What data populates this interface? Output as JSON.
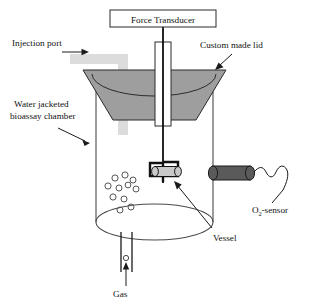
{
  "figure": {
    "title_box": {
      "label": "Force Transducer"
    },
    "labels": {
      "injection_port": "Injection port",
      "custom_made_lid": "Custom made lid",
      "water_jacketed_line1": "Water jacketed",
      "water_jacketed_line2": "bioassay chamber",
      "vessel": "Vessel",
      "gas": "Gas",
      "o2_sensor_main": "O",
      "o2_sensor_sub": "2",
      "o2_sensor_tail": "-sensor"
    },
    "colors": {
      "outline": "#1a1a1a",
      "chamber_wall": "#4a4a4a",
      "lid_fill": "#9e9e9e",
      "lid_stroke": "#2b2b2b",
      "injection_tube": "#dcdcdc",
      "sensor_fill": "#5a5a5a",
      "sensor_stroke": "#1a1a1a",
      "vessel_fill": "#c9c9c9",
      "bracket": "#111111",
      "rod": "#000000",
      "bubble_stroke": "#555555",
      "text": "#111111",
      "background": "#ffffff"
    },
    "bubbles": [
      {
        "cx": 115,
        "cy": 178,
        "r": 3.1
      },
      {
        "cx": 125,
        "cy": 175,
        "r": 3.1
      },
      {
        "cx": 133,
        "cy": 180,
        "r": 3.0
      },
      {
        "cx": 108,
        "cy": 186,
        "r": 3.1
      },
      {
        "cx": 119,
        "cy": 188,
        "r": 3.0
      },
      {
        "cx": 128,
        "cy": 185,
        "r": 2.9
      },
      {
        "cx": 136,
        "cy": 189,
        "r": 3.0
      },
      {
        "cx": 113,
        "cy": 197,
        "r": 3.1
      },
      {
        "cx": 124,
        "cy": 199,
        "r": 3.0
      },
      {
        "cx": 131,
        "cy": 207,
        "r": 3.0
      },
      {
        "cx": 120,
        "cy": 210,
        "r": 3.0
      }
    ],
    "gas_tube_bubble": {
      "cx": 126,
      "cy": 258,
      "r": 2.6
    }
  }
}
